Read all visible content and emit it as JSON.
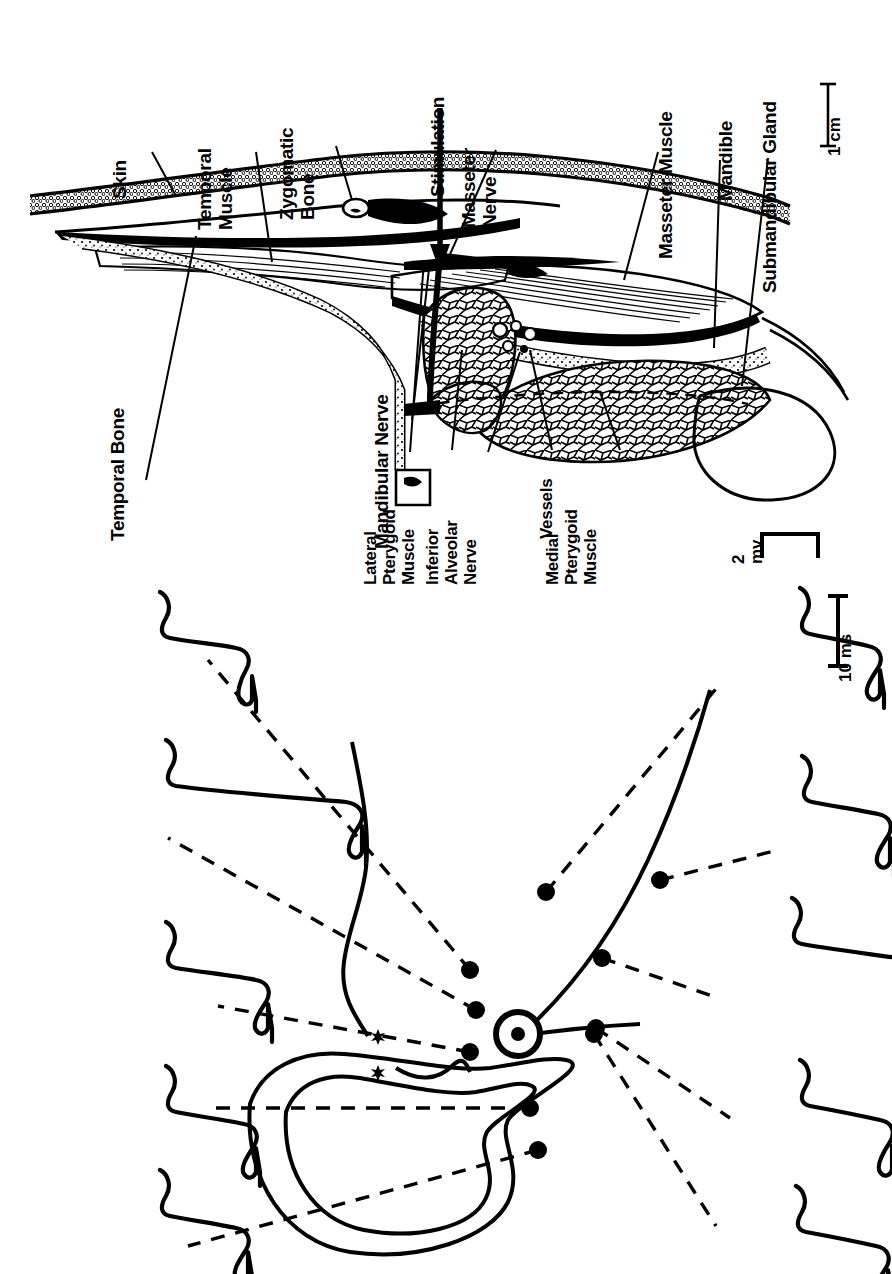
{
  "figure": {
    "background_color": "#ffffff",
    "ink_color": "#000000",
    "orientation_note": "all text rotated 90 degrees counter-clockwise"
  },
  "panel_anatomy": {
    "name": "sagittal-section-diagram",
    "labels": [
      {
        "id": "skin",
        "text": "Skin"
      },
      {
        "id": "temporal-muscle",
        "text": "Temporal\nMuscle"
      },
      {
        "id": "zygomatic-bone",
        "text": "Zygomatic\nBone"
      },
      {
        "id": "stimulation",
        "text": "Stimulation",
        "bold": true
      },
      {
        "id": "masseter-nerve",
        "text": "Masseter\nNerve"
      },
      {
        "id": "masseter-muscle",
        "text": "Masseter Muscle"
      },
      {
        "id": "mandible",
        "text": "Mandible"
      },
      {
        "id": "submandibular-gland",
        "text": "Submandibular Gland"
      },
      {
        "id": "temporal-bone",
        "text": "Temporal Bone"
      },
      {
        "id": "mandibular-nerve",
        "text": "Mandibular Nerve"
      },
      {
        "id": "lateral-pterygoid-muscle",
        "text": "Lateral\nPterygoid\nMuscle"
      },
      {
        "id": "inferior-alveolar-nerve",
        "text": "Inferior\nAlveolar\nNerve"
      },
      {
        "id": "vessels",
        "text": "Vessels"
      },
      {
        "id": "medial-pterygoid-muscle",
        "text": "Medial\nPterygoid\nMuscle"
      }
    ],
    "scale_bar": {
      "id": "length-scale",
      "text": "1 cm"
    }
  },
  "panel_emg": {
    "name": "emg-mapping-panel",
    "stimulation_site_marker": "bullseye",
    "asterisk_count": 2,
    "scale_bars": [
      {
        "id": "amplitude-scale",
        "text": "2\nmv",
        "type": "bracket"
      },
      {
        "id": "time-scale",
        "text": "10 ms",
        "type": "ibeam"
      }
    ],
    "recording_sites_left": 5,
    "recording_sites_right": 5,
    "traces_left": [
      {
        "id": "trace-L1",
        "amplitude_mv": 1.6
      },
      {
        "id": "trace-L2",
        "amplitude_mv": 4.4
      },
      {
        "id": "trace-L3",
        "amplitude_mv": 2.0
      },
      {
        "id": "trace-L4",
        "amplitude_mv": 1.7
      },
      {
        "id": "trace-L5",
        "amplitude_mv": 1.5
      }
    ],
    "traces_right": [
      {
        "id": "trace-R1",
        "amplitude_mv": 1.7
      },
      {
        "id": "trace-R2",
        "amplitude_mv": 1.9
      },
      {
        "id": "trace-R3",
        "amplitude_mv": 4.2
      },
      {
        "id": "trace-R4",
        "amplitude_mv": 2.1
      },
      {
        "id": "trace-R5",
        "amplitude_mv": 2.0
      }
    ]
  }
}
